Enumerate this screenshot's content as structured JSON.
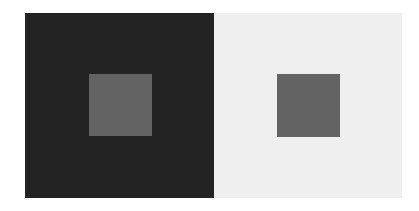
{
  "figure": {
    "background_color": "#ffffff",
    "panels": [
      {
        "name": "dark-panel",
        "color": "#232323",
        "rect": [
          25,
          13,
          189,
          185
        ],
        "inner": {
          "color": "#636363",
          "rect": [
            89,
            74,
            63,
            62
          ]
        }
      },
      {
        "name": "light-panel",
        "color": "#efefef",
        "rect": [
          214,
          13,
          188,
          185
        ],
        "inner": {
          "color": "#636363",
          "rect": [
            277,
            74,
            63,
            63
          ]
        }
      }
    ]
  }
}
